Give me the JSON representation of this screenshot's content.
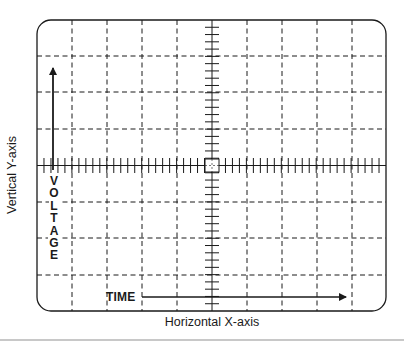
{
  "diagram": {
    "labels": {
      "y_axis": "Vertical Y-axis",
      "x_axis": "Horizontal X-axis",
      "voltage_letters": [
        "V",
        "O",
        "L",
        "T",
        "A",
        "G",
        "E"
      ],
      "time": "TIME"
    },
    "grid": {
      "major_divisions_x": 10,
      "major_divisions_y": 8,
      "minor_ticks_per_division": 5,
      "line_style": "dashed",
      "center_axes_style": "tick-marked"
    },
    "arrows": [
      {
        "name": "voltage-arrow",
        "direction": "up"
      },
      {
        "name": "time-arrow",
        "direction": "right"
      }
    ],
    "colors": {
      "ink": "#1a1a1a",
      "background": "#ffffff",
      "rule": "#c8c8c8"
    }
  }
}
